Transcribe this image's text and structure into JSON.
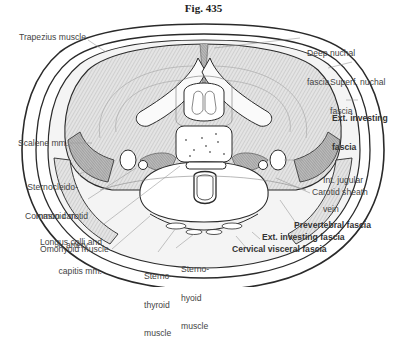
{
  "figure": {
    "title": "Fig. 435"
  },
  "labels": {
    "trapezius": "Trapezius muscle",
    "scalene": "Scalene mm.",
    "scm_1": "Sternocleido-",
    "scm_2": "mastoid m.",
    "carotid_1": "Common carotid",
    "carotid_2": "artery",
    "longus_1": "Longus colli and",
    "longus_2": "capitis mm.",
    "omohyoid": "Omohyoid muscle",
    "sternothyroid_1": "Sterno-",
    "sternothyroid_2": "thyroid",
    "sternothyroid_3": "muscle",
    "sternohyoid_1": "Sterno-",
    "sternohyoid_2": "hyoid",
    "sternohyoid_3": "muscle",
    "deep_nuchal_1": "Deep nuchal",
    "deep_nuchal_2": "fascia",
    "superf_nuchal_1": "Superf. nuchal",
    "superf_nuchal_2": "fascia",
    "ext_investing_top_1": "Ext. investing",
    "ext_investing_top_2": "fascia",
    "jugular_1": "Int. jugular",
    "jugular_2": "vein",
    "carotid_sheath": "Carotid sheath",
    "prevertebral": "Prevertebral fascia",
    "ext_investing_bottom": "Ext. investing fascia",
    "cervical_visceral": "Cervical visceral fascia"
  },
  "colors": {
    "outline": "#2a2a2a",
    "leader": "#999999",
    "muscle_fill": "#d9d9d9",
    "muscle_dark": "#9a9a9a"
  }
}
